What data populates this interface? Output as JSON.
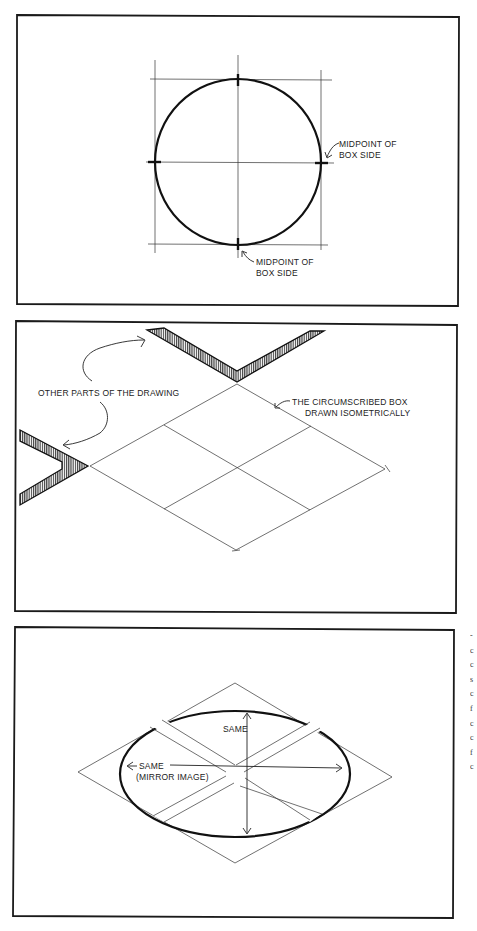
{
  "panels": [
    {
      "id": "circle-in-box",
      "labels": {
        "right_midpoint_line1": "MIDPOINT OF",
        "right_midpoint_line2": "BOX SIDE",
        "bottom_midpoint_line1": "MIDPOINT OF",
        "bottom_midpoint_line2": "BOX SIDE"
      }
    },
    {
      "id": "isometric-box",
      "labels": {
        "other_parts": "OTHER PARTS OF THE DRAWING",
        "box_line1": "THE CIRCUMSCRIBED BOX",
        "box_line2": "DRAWN ISOMETRICALLY"
      }
    },
    {
      "id": "isometric-ellipse",
      "labels": {
        "vertical_same": "SAME",
        "horizontal_same": "SAME",
        "mirror_image": "(MIRROR IMAGE)"
      }
    }
  ],
  "margin_text_fragments": [
    "-",
    "c",
    "c",
    "s",
    "c",
    "f",
    "c",
    "c",
    "f",
    "c"
  ],
  "colors": {
    "ink": "#111111",
    "paper": "#ffffff"
  }
}
